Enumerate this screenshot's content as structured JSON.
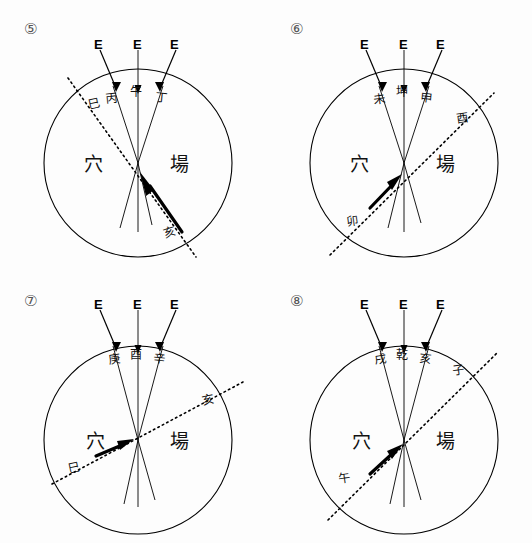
{
  "figure": {
    "title_visible": false,
    "background_color": "#fdfdfd",
    "ink_color": "#000000",
    "panel_count": 4
  },
  "common": {
    "beam_label": "E",
    "left_region_label": "穴",
    "right_region_label": "場",
    "beam_count": 3,
    "axis_line_style": "solid",
    "reference_line_style": "dotted"
  },
  "panels": [
    {
      "id": "panel-5",
      "number": "⑤",
      "beams": [
        {
          "label": "E",
          "name": "beam-left"
        },
        {
          "label": "E",
          "name": "beam-center"
        },
        {
          "label": "E",
          "name": "beam-right"
        }
      ],
      "rim_labels": [
        {
          "text": "巳",
          "name": "rim-label-si"
        },
        {
          "text": "丙",
          "name": "rim-label-bing"
        },
        {
          "text": "午",
          "name": "rim-label-wu"
        },
        {
          "text": "丁",
          "name": "rim-label-ding"
        }
      ],
      "region_left": "穴",
      "region_right": "場",
      "dotted_far_label": "亥",
      "dotted_near_label": "",
      "arrow_direction": "up-left"
    },
    {
      "id": "panel-6",
      "number": "⑥",
      "beams": [
        {
          "label": "E",
          "name": "beam-left"
        },
        {
          "label": "E",
          "name": "beam-center"
        },
        {
          "label": "E",
          "name": "beam-right"
        }
      ],
      "rim_labels": [
        {
          "text": "未",
          "name": "rim-label-wei"
        },
        {
          "text": "坤",
          "name": "rim-label-kun"
        },
        {
          "text": "申",
          "name": "rim-label-shen"
        },
        {
          "text": "酉",
          "name": "rim-label-you"
        }
      ],
      "region_left": "穴",
      "region_right": "場",
      "dotted_far_label": "酉",
      "dotted_near_label": "卯",
      "arrow_direction": "up-right"
    },
    {
      "id": "panel-7",
      "number": "⑦",
      "beams": [
        {
          "label": "E",
          "name": "beam-left"
        },
        {
          "label": "E",
          "name": "beam-center"
        },
        {
          "label": "E",
          "name": "beam-right"
        }
      ],
      "rim_labels": [
        {
          "text": "庚",
          "name": "rim-label-geng"
        },
        {
          "text": "酉",
          "name": "rim-label-you"
        },
        {
          "text": "辛",
          "name": "rim-label-xin"
        }
      ],
      "region_left": "穴",
      "region_right": "場",
      "dotted_far_label": "亥",
      "dotted_near_label": "巳",
      "arrow_direction": "up-right"
    },
    {
      "id": "panel-8",
      "number": "⑧",
      "beams": [
        {
          "label": "E",
          "name": "beam-left"
        },
        {
          "label": "E",
          "name": "beam-center"
        },
        {
          "label": "E",
          "name": "beam-right"
        }
      ],
      "rim_labels": [
        {
          "text": "戌",
          "name": "rim-label-xu"
        },
        {
          "text": "乾",
          "name": "rim-label-qian"
        },
        {
          "text": "亥",
          "name": "rim-label-hai"
        }
      ],
      "region_left": "穴",
      "region_right": "場",
      "dotted_far_label": "子",
      "dotted_near_label": "午",
      "arrow_direction": "up-right"
    }
  ]
}
